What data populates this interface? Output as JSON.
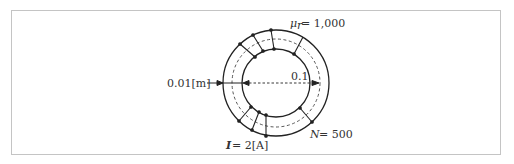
{
  "diagram": {
    "labels": {
      "permeability_symbol": "μ",
      "permeability_sub": "r",
      "permeability_value": "= 1,000",
      "width_label": "0.01[m]",
      "radius_label": "0.1",
      "turns_symbol": "N",
      "turns_value": "= 500",
      "current_symbol": "I",
      "current_value": "= 2[A]"
    },
    "values": {
      "relative_permeability": 1000,
      "core_width_m": 0.01,
      "mean_radius": 0.1,
      "turns": 500,
      "current_A": 2
    },
    "colors": {
      "line": "#222222",
      "frame": "#c4c4c4",
      "text": "#333333"
    }
  }
}
